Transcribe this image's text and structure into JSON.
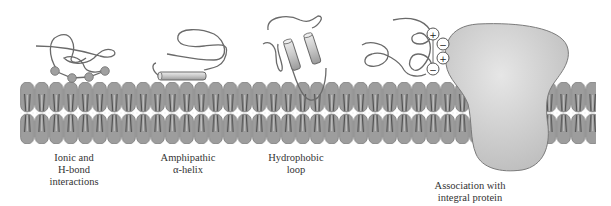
{
  "figure": {
    "type": "peripheral membrane protein association modes",
    "colors": {
      "background": "#ffffff",
      "lipid_head": "#9a9a9a",
      "lipid_head_stroke": "#6e6e6e",
      "lipid_tail": "#555555",
      "integral_protein": "#cfcfcf",
      "integral_protein_stroke": "#7a7a7a",
      "protein_chain": "#6a6a6a",
      "helix_fill": "#d8d8d8",
      "text": "#333333"
    },
    "labels": [
      {
        "id": "ionic",
        "lines": [
          "Ionic and",
          "H-bond",
          "interactions"
        ]
      },
      {
        "id": "amphipathic",
        "lines": [
          "Amphipathic",
          "α-helix"
        ]
      },
      {
        "id": "hydrophobic",
        "lines": [
          "Hydrophobic",
          "loop"
        ]
      },
      {
        "id": "integral",
        "lines": [
          "Association with",
          "integral protein"
        ]
      }
    ],
    "charges": [
      "+",
      "−",
      "+",
      "−"
    ]
  }
}
